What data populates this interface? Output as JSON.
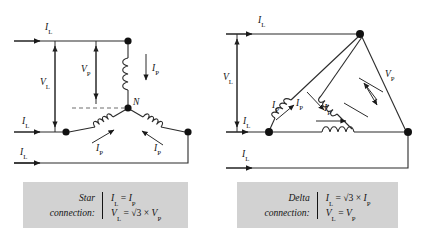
{
  "figure": {
    "panels": [
      {
        "id": "star",
        "name": "Star connection",
        "labels": {
          "line_current_top": "I",
          "line_current_top_sub": "L",
          "line_current_mid": "I",
          "line_current_mid_sub": "L",
          "line_current_bottom": "I",
          "line_current_bottom_sub": "L",
          "line_voltage": "V",
          "line_voltage_sub": "L",
          "phase_voltage": "V",
          "phase_voltage_sub": "P",
          "phase_current_right": "I",
          "phase_current_right_sub": "P",
          "phase_current_left": "I",
          "phase_current_left_sub": "P",
          "phase_current_bottom": "I",
          "phase_current_bottom_sub": "P",
          "neutral": "N"
        },
        "legend": {
          "name_line1": "Star",
          "name_line2": "connection:",
          "eq1": "Iₗ = Iₚ",
          "eq2": "Vₗ = √3 × Vₚ",
          "eq1_parts": {
            "lhs": "I",
            "lhs_sub": "L",
            "eq": "=",
            "rhs": "I",
            "rhs_sub": "P",
            "factor": ""
          },
          "eq2_parts": {
            "lhs": "V",
            "lhs_sub": "L",
            "eq": "=",
            "factor": "√3 ×",
            "rhs": "V",
            "rhs_sub": "P"
          }
        }
      },
      {
        "id": "delta",
        "name": "Delta connection",
        "labels": {
          "line_current_top": "I",
          "line_current_top_sub": "L",
          "line_current_mid": "I",
          "line_current_mid_sub": "L",
          "line_current_bottom": "I",
          "line_current_bottom_sub": "L",
          "line_voltage": "V",
          "line_voltage_sub": "L",
          "phase_voltage": "V",
          "phase_voltage_sub": "P",
          "phase_current_left": "I",
          "phase_current_left_sub": "P",
          "phase_current_right": "I",
          "phase_current_right_sub": "P",
          "phase_current_bottom": "I",
          "phase_current_bottom_sub": "P"
        },
        "legend": {
          "name_line1": "Delta",
          "name_line2": "connection:",
          "eq1": "Iₗ = √3 × Iₚ",
          "eq2": "Vₗ = Vₚ",
          "eq1_parts": {
            "lhs": "I",
            "lhs_sub": "L",
            "eq": "=",
            "factor": "√3 ×",
            "rhs": "I",
            "rhs_sub": "P"
          },
          "eq2_parts": {
            "lhs": "V",
            "lhs_sub": "L",
            "eq": "=",
            "factor": "",
            "rhs": "V",
            "rhs_sub": "P"
          }
        }
      }
    ],
    "colors": {
      "line": "#2b2b2b",
      "node": "#111111",
      "dashed": "#6f6f6f",
      "legend_background": "#d2d2d2",
      "text": "#141414",
      "page_background": "#ffffff"
    }
  }
}
